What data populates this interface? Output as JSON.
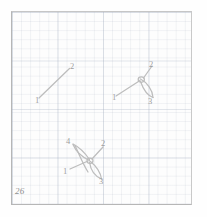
{
  "plate": {
    "number": "26"
  },
  "colors": {
    "stroke": "#bdbdbd",
    "label": "#9d9d9d",
    "grid_minor": "rgba(170,180,195,0.16)",
    "grid_major": "rgba(160,172,190,0.30)",
    "border": "#b6b6b6",
    "paper": "#fdfdfd"
  },
  "figures": [
    {
      "id": "figure-1",
      "name": "single-arc",
      "endpoint_count": 2,
      "labels": [
        {
          "text": "1",
          "x": 35,
          "y": 96
        },
        {
          "text": "2",
          "x": 70,
          "y": 62
        }
      ]
    },
    {
      "id": "figure-2",
      "name": "three-branch-vertex-with-loop",
      "endpoint_count": 3,
      "labels": [
        {
          "text": "1",
          "x": 112,
          "y": 93
        },
        {
          "text": "2",
          "x": 149,
          "y": 60
        },
        {
          "text": "3",
          "x": 148,
          "y": 97
        }
      ]
    },
    {
      "id": "figure-3",
      "name": "four-branch-crossing-with-two-loops",
      "endpoint_count": 4,
      "labels": [
        {
          "text": "4",
          "x": 66,
          "y": 137
        },
        {
          "text": "2",
          "x": 101,
          "y": 139
        },
        {
          "text": "1",
          "x": 63,
          "y": 167
        },
        {
          "text": "3",
          "x": 99,
          "y": 177
        }
      ]
    }
  ]
}
